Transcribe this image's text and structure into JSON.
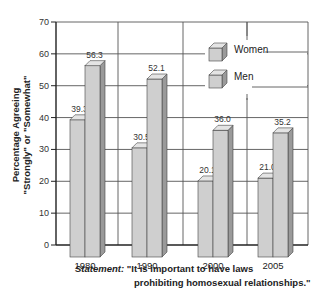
{
  "chart_data": {
    "type": "bar",
    "title": "",
    "xlabel": "",
    "ylabel": "Percentage Agreeing \"Strongly\" or \"Somewhat\"",
    "ylabel_lines": [
      "Percentage Agreeing",
      "\"Strongly\" or \"Somewhat\""
    ],
    "ylim": [
      0,
      70
    ],
    "yticks": [
      0,
      10,
      20,
      30,
      40,
      50,
      60,
      70
    ],
    "categories": [
      "1980",
      "1990",
      "2000",
      "2005"
    ],
    "series": [
      {
        "name": "Women",
        "values": [
          39.3,
          30.5,
          20.1,
          21.0
        ],
        "labels": [
          "39.3",
          "30.5",
          "20.1",
          "21.0"
        ]
      },
      {
        "name": "Men",
        "values": [
          56.3,
          52.1,
          36.0,
          35.2
        ],
        "labels": [
          "56.3",
          "52.1",
          "36.0",
          "35.2"
        ]
      }
    ],
    "grid": true,
    "legend_position": "upper-right-inside",
    "style": "3d-bars",
    "annotation": {
      "lead": "Statement:",
      "line1": "\"It is important to have laws",
      "line2": "prohibiting homosexual relationships.\""
    }
  },
  "colors": {
    "bar_front": "#cfcfcf",
    "bar_top": "#e4e4e4",
    "bar_side": "#9a9a9a",
    "grid": "#555555",
    "axis": "#222222"
  }
}
